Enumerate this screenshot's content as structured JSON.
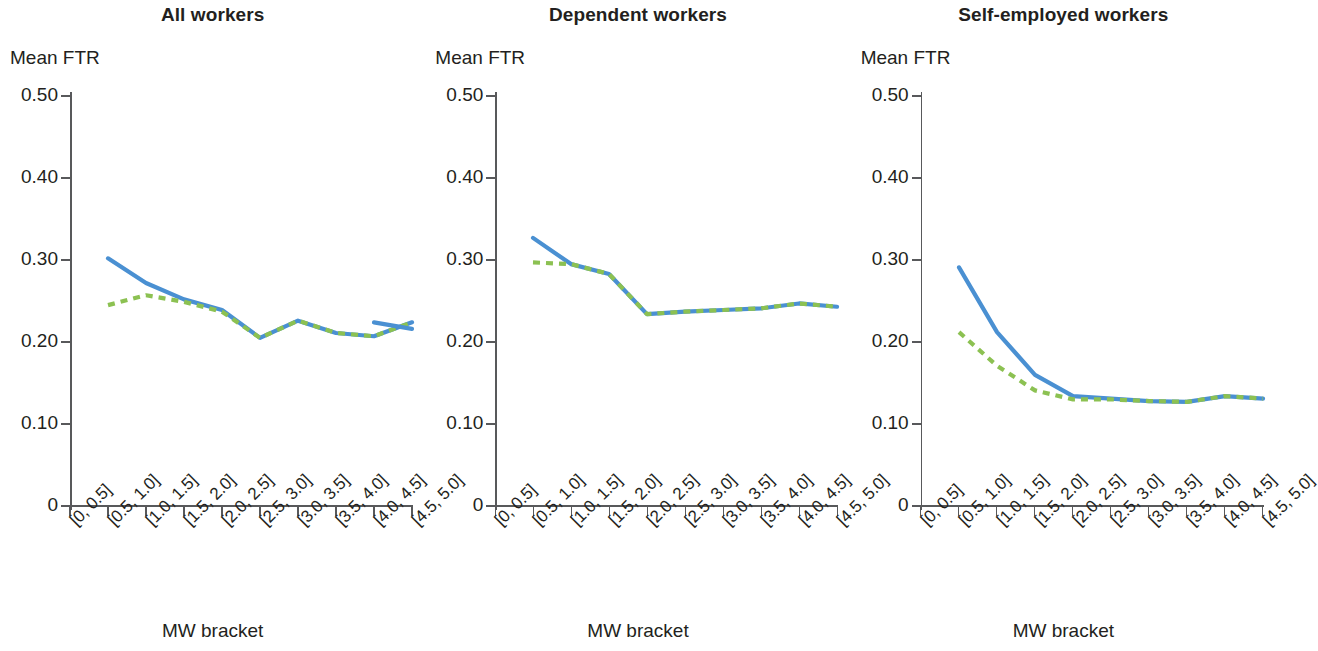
{
  "figure": {
    "y_axis_label": "Mean FTR",
    "x_axis_label": "MW bracket",
    "colors": {
      "solid": "#4a90d2",
      "dashed": "#8cc152",
      "axis": "#58595b",
      "text": "#231f20"
    }
  },
  "panels": [
    {
      "title": "All workers"
    },
    {
      "title": "Dependent workers"
    },
    {
      "title": "Self-employed workers"
    }
  ],
  "axis": {
    "y_ticks": [
      "0.50",
      "0.40",
      "0.30",
      "0.20",
      "0.10",
      "0"
    ],
    "y_tick_values": [
      0.5,
      0.4,
      0.3,
      0.2,
      0.1,
      0
    ],
    "x_ticks": [
      "[0, 0.5]",
      "[0.5, 1.0]",
      "[1.0, 1.5]",
      "[1.5, 2.0]",
      "[2.0, 2.5]",
      "[2.5, 3.0]",
      "[3.0, 3.5]",
      "[3.5, 4.0]",
      "[4.0, 4.5]",
      "[4.5, 5.0]"
    ]
  },
  "chart_data": [
    {
      "type": "line",
      "title": "All workers",
      "xlabel": "MW bracket",
      "ylabel": "Mean FTR",
      "ylim": [
        0,
        0.5
      ],
      "grid": false,
      "legend": "none",
      "categories": [
        "[0, 0.5]",
        "[0.5, 1.0]",
        "[1.0, 1.5]",
        "[1.5, 2.0]",
        "[2.0, 2.5]",
        "[2.5, 3.0]",
        "[3.0, 3.5]",
        "[3.5, 4.0]",
        "[4.0, 4.5]",
        "[4.5, 5.0]"
      ],
      "series": [
        {
          "name": "solid-blue",
          "style": "solid",
          "color": "#4a90d2",
          "values": [
            null,
            0.302,
            0.272,
            0.252,
            0.239,
            0.205,
            0.226,
            0.211,
            0.207,
            0.224
          ]
        },
        {
          "name": "dashed-green",
          "style": "dashed",
          "color": "#8cc152",
          "values": [
            null,
            0.245,
            0.257,
            0.249,
            0.237,
            0.205,
            0.226,
            0.211,
            0.207,
            0.224
          ]
        },
        {
          "name": "solid-blue-tail",
          "style": "solid",
          "color": "#4a90d2",
          "values": [
            null,
            null,
            null,
            null,
            null,
            null,
            null,
            null,
            0.224,
            0.216
          ]
        }
      ]
    },
    {
      "type": "line",
      "title": "Dependent workers",
      "xlabel": "MW bracket",
      "ylabel": "Mean FTR",
      "ylim": [
        0,
        0.5
      ],
      "grid": false,
      "legend": "none",
      "categories": [
        "[0, 0.5]",
        "[0.5, 1.0]",
        "[1.0, 1.5]",
        "[1.5, 2.0]",
        "[2.0, 2.5]",
        "[2.5, 3.0]",
        "[3.0, 3.5]",
        "[3.5, 4.0]",
        "[4.0, 4.5]",
        "[4.5, 5.0]"
      ],
      "series": [
        {
          "name": "solid-blue",
          "style": "solid",
          "color": "#4a90d2",
          "values": [
            null,
            0.327,
            0.295,
            0.283,
            0.234,
            0.237,
            0.239,
            0.241,
            0.247,
            0.243
          ]
        },
        {
          "name": "dashed-green",
          "style": "dashed",
          "color": "#8cc152",
          "values": [
            null,
            0.297,
            0.295,
            0.283,
            0.234,
            0.237,
            0.239,
            0.241,
            0.247,
            0.243
          ]
        }
      ]
    },
    {
      "type": "line",
      "title": "Self-employed workers",
      "xlabel": "MW bracket",
      "ylabel": "Mean FTR",
      "ylim": [
        0,
        0.5
      ],
      "grid": false,
      "legend": "none",
      "categories": [
        "[0, 0.5]",
        "[0.5, 1.0]",
        "[1.0, 1.5]",
        "[1.5, 2.0]",
        "[2.0, 2.5]",
        "[2.5, 3.0]",
        "[3.0, 3.5]",
        "[3.5, 4.0]",
        "[4.0, 4.5]",
        "[4.5, 5.0]"
      ],
      "series": [
        {
          "name": "solid-blue",
          "style": "solid",
          "color": "#4a90d2",
          "values": [
            null,
            0.291,
            0.212,
            0.16,
            0.134,
            0.131,
            0.128,
            0.127,
            0.134,
            0.131
          ]
        },
        {
          "name": "dashed-green",
          "style": "dashed",
          "color": "#8cc152",
          "values": [
            null,
            0.212,
            0.171,
            0.141,
            0.13,
            0.13,
            0.128,
            0.127,
            0.134,
            0.131
          ]
        }
      ]
    }
  ]
}
